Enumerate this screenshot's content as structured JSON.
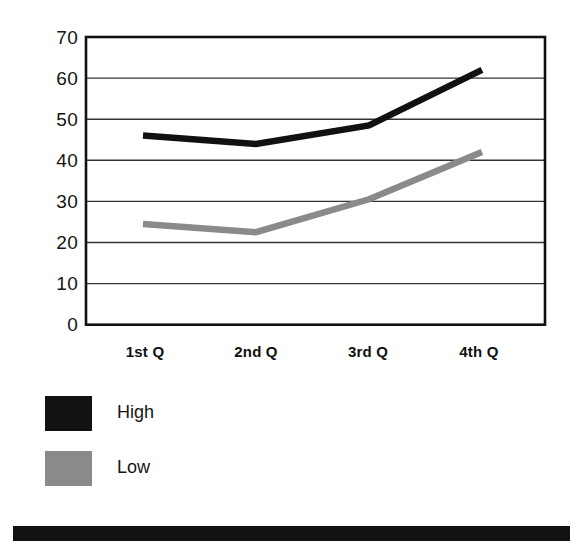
{
  "chart_data": {
    "type": "line",
    "title": "",
    "xlabel": "",
    "ylabel": "",
    "categories": [
      "1st Q",
      "2nd Q",
      "3rd Q",
      "4th Q"
    ],
    "series": [
      {
        "name": "High",
        "color": "#111111",
        "values": [
          46,
          44,
          48.5,
          62
        ]
      },
      {
        "name": "Low",
        "color": "#8a8a8a",
        "values": [
          24.5,
          22.5,
          30.5,
          42
        ]
      }
    ],
    "ylim": [
      0,
      70
    ],
    "ytick_step": 10,
    "ytick_labels": [
      "70",
      "60",
      "50",
      "40",
      "30",
      "20",
      "10",
      "0"
    ],
    "grid": true,
    "legend_position": "below-left"
  },
  "legend": {
    "entries": [
      {
        "label": "High",
        "color": "#111111"
      },
      {
        "label": "Low",
        "color": "#8a8a8a"
      }
    ]
  },
  "footer": {
    "bar_color": "#111111"
  },
  "colors": {
    "high": "#111111",
    "low": "#8a8a8a",
    "axis": "#111111",
    "gridline": "#333333",
    "background": "#ffffff"
  }
}
